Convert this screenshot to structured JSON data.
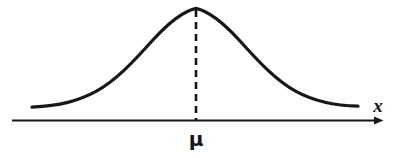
{
  "figure": {
    "name": "normal-distribution-curve",
    "background_color": "#ffffff",
    "stroke_color": "#17171a",
    "width": 407,
    "height": 158
  },
  "labels": {
    "x_axis": "x",
    "mean": "μ"
  },
  "chart_data": {
    "type": "line",
    "title": "",
    "xlabel": "x",
    "ylabel": "",
    "grid": false,
    "legend": false,
    "annotations": [
      {
        "name": "mean-tick-label",
        "text": "μ",
        "x_px": 196,
        "y_px": 137,
        "description": "mean label beneath horizontal axis"
      },
      {
        "name": "x-axis-arrow-label",
        "text": "x",
        "x_px": 378,
        "y_px": 103,
        "description": "italic variable label above axis arrowhead"
      }
    ],
    "axis": {
      "name": "x-axis",
      "y_px": 120,
      "x_start_px": 12,
      "x_end_px": 385,
      "arrowhead": true,
      "stroke_width": 2
    },
    "mean_line": {
      "name": "mean-dashed-line",
      "x_px": 196,
      "y_top_px": 10,
      "y_bottom_px": 120,
      "dash": "7 5",
      "stroke_width": 2.6
    },
    "curve": {
      "name": "bell-curve",
      "stroke_width": 3.2,
      "mean_px": 196,
      "peak_y_px": 8,
      "baseline_y_px": 120,
      "x_min_px": 32,
      "x_max_px": 358,
      "path": "M 32,107.2 C 60,105.6 78,101.2 96,91.4 C 116,80.4 134,61.0 152,41.0 C 168,23.4 182,11.4 196,8.4 C 210,11.4 224,23.4 240,41.0 C 258,61.0 276,80.4 296,91.4 C 314,101.2 332,105.6 358,106.2"
    },
    "series": [
      {
        "name": "normal-density",
        "x": [
          32,
          52,
          72,
          92,
          112,
          132,
          152,
          172,
          196,
          220,
          240,
          260,
          280,
          300,
          320,
          340,
          358
        ],
        "y_px": [
          107.2,
          106.0,
          103.0,
          96.0,
          84.0,
          66.0,
          45.0,
          22.0,
          8.4,
          22.0,
          45.0,
          66.0,
          84.0,
          96.0,
          103.0,
          106.0,
          106.2
        ]
      }
    ]
  }
}
